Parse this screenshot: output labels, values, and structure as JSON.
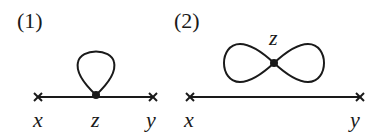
{
  "diagrams": [
    {
      "label": "(1)",
      "type": "tadpole",
      "vertices": {
        "left": "x",
        "center": "z",
        "right": "y"
      }
    },
    {
      "label": "(2)",
      "type": "figure-eight",
      "vertices": {
        "left": "x",
        "center": "z",
        "right": "y"
      }
    }
  ],
  "colors": {
    "ink": "#1a1a1a",
    "background": "#ffffff"
  }
}
